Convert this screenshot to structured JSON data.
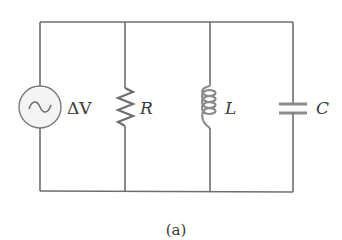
{
  "diagram": {
    "type": "parallel RLC circuit",
    "caption": "(a)",
    "colors": {
      "wire": "#6e6e6e",
      "source_fill": "#f4f4f4",
      "label": "#3a3a3a",
      "background": "#ffffff"
    },
    "components": [
      {
        "id": "source",
        "kind": "AC voltage source",
        "symbol": "~",
        "label": "ΔV"
      },
      {
        "id": "resistor",
        "kind": "resistor",
        "label": "R"
      },
      {
        "id": "inductor",
        "kind": "inductor",
        "label": "L"
      },
      {
        "id": "capacitor",
        "kind": "capacitor",
        "label": "C"
      }
    ]
  }
}
